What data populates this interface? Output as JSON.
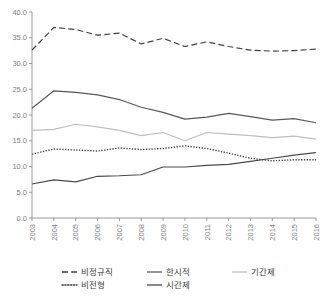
{
  "chart_data": {
    "type": "line",
    "title": "",
    "subtitle": "",
    "xlabel": "",
    "ylabel": "",
    "ylim": [
      0,
      40
    ],
    "yticks": [
      "0.0",
      "5.0",
      "10.0",
      "15.0",
      "20.0",
      "25.0",
      "30.0",
      "35.0",
      "40.0"
    ],
    "ytick_values": [
      0,
      5,
      10,
      15,
      20,
      25,
      30,
      35,
      40
    ],
    "grid": false,
    "legend_position": "bottom",
    "categories": [
      "2003",
      "2004",
      "2005",
      "2006",
      "2007",
      "2008",
      "2009",
      "2010",
      "2011",
      "2012",
      "2013",
      "2014",
      "2015",
      "2016"
    ],
    "series": [
      {
        "name": "비정규직",
        "style": "dashed",
        "color": "#3f3f3f",
        "values": [
          32.6,
          37.0,
          36.6,
          35.5,
          35.9,
          33.8,
          34.9,
          33.3,
          34.2,
          33.3,
          32.6,
          32.4,
          32.5,
          32.8
        ]
      },
      {
        "name": "한시적",
        "style": "solid",
        "color": "#595959",
        "values": [
          21.3,
          24.7,
          24.4,
          23.9,
          23.0,
          21.5,
          20.5,
          19.2,
          19.6,
          20.3,
          19.7,
          19.0,
          19.3,
          18.5
        ]
      },
      {
        "name": "기간제",
        "style": "solid",
        "color": "#bfbfbf",
        "values": [
          17.0,
          17.2,
          18.2,
          17.7,
          17.0,
          16.0,
          16.6,
          15.0,
          16.6,
          16.3,
          16.0,
          15.6,
          15.9,
          15.3
        ]
      },
      {
        "name": "비전형",
        "style": "dotted",
        "color": "#404040",
        "values": [
          12.4,
          13.4,
          13.2,
          13.0,
          13.6,
          13.3,
          13.5,
          14.0,
          13.5,
          12.6,
          11.6,
          11.1,
          11.3,
          11.3
        ]
      },
      {
        "name": "시간제",
        "style": "solid",
        "color": "#4a4a4a",
        "values": [
          6.6,
          7.4,
          7.0,
          8.1,
          8.2,
          8.4,
          9.9,
          9.9,
          10.2,
          10.4,
          11.0,
          11.6,
          12.2,
          12.7
        ]
      }
    ],
    "legend": [
      {
        "label": "비정규직",
        "style": "dashed",
        "color": "#3f3f3f"
      },
      {
        "label": "한시적",
        "style": "solid",
        "color": "#595959"
      },
      {
        "label": "기간제",
        "style": "solid",
        "color": "#bfbfbf"
      },
      {
        "label": "비전형",
        "style": "dotted",
        "color": "#404040"
      },
      {
        "label": "시간제",
        "style": "solid",
        "color": "#4a4a4a"
      }
    ]
  }
}
